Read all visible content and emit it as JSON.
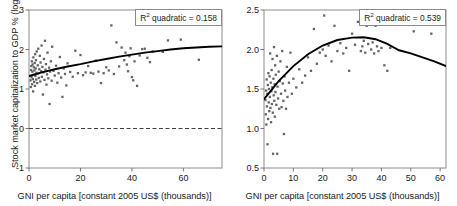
{
  "figure": {
    "panel_count": 2
  },
  "panels": [
    {
      "id": "stock-market-capitalization",
      "xlabel": "GNI per capita [constant 2005 US$ (thousands)]",
      "ylabel": "Stock market capitalization to GDP % (log)",
      "annotation_prefix": "R",
      "annotation_sup": "2",
      "annotation_text": " quadratic = 0.158"
    },
    {
      "id": "private-credit",
      "xlabel": "GNI per capita [constant 2005 US$ (thousands)]",
      "ylabel": "Private credit to GDP % (log)",
      "annotation_prefix": "R",
      "annotation_sup": "2",
      "annotation_text": " quadratic = 0.539"
    }
  ],
  "chart_data": [
    {
      "type": "scatter",
      "id": "stock-market-capitalization",
      "title": "",
      "xlabel": "GNI per capita [constant 2005 US$ (thousands)]",
      "ylabel": "Stock market capitalization to GDP % (log)",
      "xlim": [
        0,
        75
      ],
      "ylim": [
        -1,
        3
      ],
      "xticks": [
        0,
        20,
        40,
        60
      ],
      "yticks": [
        -1,
        0,
        1,
        2,
        3
      ],
      "xticklabels": [
        "0",
        "20",
        "40",
        "60"
      ],
      "yticklabels": [
        "-1",
        "0",
        "1",
        "2",
        "3"
      ],
      "grid": false,
      "legend": false,
      "annotations": [
        {
          "text": "R2 quadratic = 0.158",
          "position": "top-right",
          "boxed": true
        }
      ],
      "reference_lines": [
        {
          "orientation": "horizontal",
          "y": 0,
          "style": "dashed"
        }
      ],
      "fit": {
        "kind": "quadratic",
        "r2": 0.158,
        "description": "gently rising concave curve from about 1.33 at x=0 to about 2.08 at x=75",
        "points": [
          [
            0,
            1.33
          ],
          [
            5,
            1.42
          ],
          [
            10,
            1.5
          ],
          [
            15,
            1.57
          ],
          [
            20,
            1.63
          ],
          [
            25,
            1.7
          ],
          [
            30,
            1.76
          ],
          [
            35,
            1.82
          ],
          [
            40,
            1.87
          ],
          [
            45,
            1.92
          ],
          [
            50,
            1.96
          ],
          [
            55,
            2.0
          ],
          [
            60,
            2.03
          ],
          [
            65,
            2.05
          ],
          [
            70,
            2.07
          ],
          [
            75,
            2.08
          ]
        ]
      },
      "points": [
        [
          0.6,
          1.22
        ],
        [
          0.7,
          1.05
        ],
        [
          0.8,
          1.48
        ],
        [
          0.9,
          1.58
        ],
        [
          1.0,
          1.3
        ],
        [
          1.1,
          1.7
        ],
        [
          1.2,
          1.12
        ],
        [
          1.3,
          1.44
        ],
        [
          1.4,
          1.62
        ],
        [
          1.5,
          1.25
        ],
        [
          1.6,
          0.94
        ],
        [
          1.7,
          1.8
        ],
        [
          1.8,
          1.36
        ],
        [
          1.9,
          1.55
        ],
        [
          2.0,
          1.18
        ],
        [
          2.1,
          1.47
        ],
        [
          2.2,
          1.66
        ],
        [
          2.3,
          1.08
        ],
        [
          2.4,
          1.88
        ],
        [
          2.5,
          1.33
        ],
        [
          2.6,
          1.52
        ],
        [
          2.7,
          1.73
        ],
        [
          2.8,
          1.24
        ],
        [
          2.9,
          1.41
        ],
        [
          3.0,
          1.95
        ],
        [
          3.2,
          1.15
        ],
        [
          3.4,
          1.6
        ],
        [
          3.5,
          1.39
        ],
        [
          3.6,
          2.02
        ],
        [
          3.8,
          1.28
        ],
        [
          4.0,
          1.5
        ],
        [
          4.2,
          1.84
        ],
        [
          4.4,
          1.19
        ],
        [
          4.5,
          1.67
        ],
        [
          4.7,
          1.45
        ],
        [
          4.9,
          2.1
        ],
        [
          5.0,
          1.31
        ],
        [
          5.2,
          1.56
        ],
        [
          5.4,
          0.86
        ],
        [
          5.6,
          1.42
        ],
        [
          5.8,
          1.76
        ],
        [
          6.0,
          1.23
        ],
        [
          6.2,
          2.22
        ],
        [
          6.4,
          1.49
        ],
        [
          6.6,
          1.63
        ],
        [
          6.8,
          1.11
        ],
        [
          7.0,
          1.37
        ],
        [
          7.2,
          1.92
        ],
        [
          7.5,
          1.27
        ],
        [
          7.8,
          1.54
        ],
        [
          8.0,
          0.62
        ],
        [
          8.2,
          1.44
        ],
        [
          8.5,
          1.7
        ],
        [
          8.8,
          1.21
        ],
        [
          9.0,
          2.07
        ],
        [
          9.5,
          1.46
        ],
        [
          10.0,
          1.34
        ],
        [
          10.5,
          1.59
        ],
        [
          11.0,
          1.16
        ],
        [
          11.5,
          1.4
        ],
        [
          12.0,
          1.81
        ],
        [
          12.5,
          1.29
        ],
        [
          13.0,
          0.8
        ],
        [
          13.5,
          1.52
        ],
        [
          14.0,
          1.38
        ],
        [
          14.5,
          1.09
        ],
        [
          15.0,
          1.65
        ],
        [
          16.0,
          1.43
        ],
        [
          17.0,
          1.31
        ],
        [
          18.0,
          1.97
        ],
        [
          19.0,
          1.4
        ],
        [
          20.0,
          1.86
        ],
        [
          21.0,
          1.35
        ],
        [
          22.0,
          1.42
        ],
        [
          23.0,
          1.58
        ],
        [
          24.0,
          1.41
        ],
        [
          25.0,
          1.39
        ],
        [
          26.0,
          1.72
        ],
        [
          27.0,
          1.44
        ],
        [
          28.0,
          1.15
        ],
        [
          29.0,
          1.4
        ],
        [
          30.0,
          1.55
        ],
        [
          31.0,
          1.47
        ],
        [
          32.0,
          2.61
        ],
        [
          33.0,
          1.38
        ],
        [
          34.0,
          2.18
        ],
        [
          35.0,
          1.57
        ],
        [
          36.0,
          2.05
        ],
        [
          37.0,
          1.73
        ],
        [
          37.5,
          1.92
        ],
        [
          38.0,
          1.62
        ],
        [
          38.5,
          1.45
        ],
        [
          39.0,
          1.83
        ],
        [
          39.5,
          2.03
        ],
        [
          40.0,
          1.3
        ],
        [
          40.5,
          1.22
        ],
        [
          41.0,
          1.7
        ],
        [
          42.0,
          1.08
        ],
        [
          43.0,
          1.85
        ],
        [
          44.0,
          2.01
        ],
        [
          45.0,
          2.02
        ],
        [
          46.0,
          1.79
        ],
        [
          47.0,
          1.68
        ],
        [
          48.0,
          1.95
        ],
        [
          52.0,
          1.94
        ],
        [
          54.0,
          2.23
        ],
        [
          59.0,
          2.25
        ],
        [
          66.0,
          1.74
        ]
      ]
    },
    {
      "type": "scatter",
      "id": "private-credit",
      "title": "",
      "xlabel": "GNI per capita [constant 2005 US$ (thousands)]",
      "ylabel": "Private credit to GDP % (log)",
      "xlim": [
        0,
        62
      ],
      "ylim": [
        0.5,
        2.5
      ],
      "xticks": [
        0,
        10,
        20,
        30,
        40,
        50,
        60
      ],
      "yticks": [
        0.5,
        1.0,
        1.5,
        2.0,
        2.5
      ],
      "xticklabels": [
        "0",
        "10",
        "20",
        "30",
        "40",
        "50",
        "60"
      ],
      "yticklabels": [
        "0.5",
        "1.0",
        "1.5",
        "2.0",
        "2.5"
      ],
      "grid": false,
      "legend": false,
      "annotations": [
        {
          "text": "R2 quadratic = 0.539",
          "position": "top-right",
          "boxed": true
        }
      ],
      "reference_lines": [],
      "fit": {
        "kind": "quadratic",
        "r2": 0.539,
        "description": "inverted-U curve rising from about 1.37 at x=0 to a peak near 2.15 around x=34, declining to about 1.79 at x=62",
        "points": [
          [
            0,
            1.37
          ],
          [
            5,
            1.6
          ],
          [
            10,
            1.79
          ],
          [
            15,
            1.94
          ],
          [
            20,
            2.05
          ],
          [
            25,
            2.12
          ],
          [
            30,
            2.15
          ],
          [
            34,
            2.155
          ],
          [
            38,
            2.13
          ],
          [
            42,
            2.07
          ],
          [
            46,
            1.99
          ],
          [
            50,
            1.95
          ],
          [
            54,
            1.9
          ],
          [
            58,
            1.85
          ],
          [
            62,
            1.79
          ]
        ]
      },
      "points": [
        [
          0.5,
          1.36
        ],
        [
          0.6,
          1.18
        ],
        [
          0.7,
          1.48
        ],
        [
          0.8,
          1.05
        ],
        [
          0.9,
          1.62
        ],
        [
          1.0,
          1.28
        ],
        [
          1.1,
          1.44
        ],
        [
          1.2,
          0.8
        ],
        [
          1.3,
          1.55
        ],
        [
          1.4,
          1.12
        ],
        [
          1.5,
          1.7
        ],
        [
          1.6,
          1.33
        ],
        [
          1.7,
          1.5
        ],
        [
          1.8,
          1.22
        ],
        [
          1.9,
          1.66
        ],
        [
          2.0,
          1.4
        ],
        [
          2.1,
          1.95
        ],
        [
          2.2,
          1.26
        ],
        [
          2.3,
          1.58
        ],
        [
          2.4,
          1.08
        ],
        [
          2.5,
          1.47
        ],
        [
          2.6,
          1.74
        ],
        [
          2.7,
          1.31
        ],
        [
          2.8,
          1.52
        ],
        [
          2.9,
          1.88
        ],
        [
          3.0,
          1.2
        ],
        [
          3.1,
          0.68
        ],
        [
          3.2,
          1.63
        ],
        [
          3.3,
          1.42
        ],
        [
          3.4,
          2.03
        ],
        [
          3.5,
          1.35
        ],
        [
          3.6,
          1.56
        ],
        [
          3.7,
          1.15
        ],
        [
          3.8,
          1.8
        ],
        [
          3.9,
          1.46
        ],
        [
          4.0,
          1.68
        ],
        [
          4.2,
          1.3
        ],
        [
          4.4,
          1.92
        ],
        [
          4.5,
          0.68
        ],
        [
          4.6,
          1.53
        ],
        [
          4.8,
          1.38
        ],
        [
          5.0,
          1.72
        ],
        [
          5.2,
          1.25
        ],
        [
          5.4,
          1.6
        ],
        [
          5.6,
          1.85
        ],
        [
          5.8,
          1.44
        ],
        [
          6.0,
          1.27
        ],
        [
          6.2,
          1.98
        ],
        [
          6.4,
          1.57
        ],
        [
          6.6,
          1.35
        ],
        [
          6.8,
          0.93
        ],
        [
          7.0,
          1.66
        ],
        [
          7.2,
          1.48
        ],
        [
          7.5,
          1.25
        ],
        [
          7.8,
          1.78
        ],
        [
          8.0,
          1.4
        ],
        [
          8.5,
          1.58
        ],
        [
          9.0,
          1.96
        ],
        [
          9.5,
          1.44
        ],
        [
          10.0,
          1.63
        ],
        [
          11.0,
          1.52
        ],
        [
          12.0,
          1.75
        ],
        [
          13.0,
          1.58
        ],
        [
          14.0,
          1.67
        ],
        [
          15.0,
          1.9
        ],
        [
          16.0,
          1.73
        ],
        [
          17.0,
          2.26
        ],
        [
          18.0,
          1.82
        ],
        [
          19.0,
          1.96
        ],
        [
          20.0,
          2.0
        ],
        [
          20.5,
          2.43
        ],
        [
          21.0,
          1.92
        ],
        [
          22.0,
          2.05
        ],
        [
          23.0,
          1.85
        ],
        [
          24.0,
          2.3
        ],
        [
          25.0,
          1.98
        ],
        [
          26.0,
          2.08
        ],
        [
          27.0,
          1.95
        ],
        [
          28.0,
          2.02
        ],
        [
          29.0,
          1.73
        ],
        [
          30.0,
          2.2
        ],
        [
          31.0,
          2.06
        ],
        [
          32.0,
          2.35
        ],
        [
          33.0,
          1.98
        ],
        [
          33.5,
          2.04
        ],
        [
          34.0,
          2.11
        ],
        [
          34.5,
          1.96
        ],
        [
          35.0,
          2.3
        ],
        [
          35.5,
          2.07
        ],
        [
          36.0,
          2.33
        ],
        [
          36.5,
          2.0
        ],
        [
          37.0,
          2.09
        ],
        [
          37.5,
          1.95
        ],
        [
          38.0,
          2.3
        ],
        [
          38.5,
          2.04
        ],
        [
          39.0,
          1.98
        ],
        [
          40.0,
          2.02
        ],
        [
          41.0,
          1.8
        ],
        [
          42.0,
          1.73
        ],
        [
          43.0,
          2.02
        ],
        [
          51.0,
          2.23
        ],
        [
          57.0,
          2.2
        ]
      ]
    }
  ]
}
